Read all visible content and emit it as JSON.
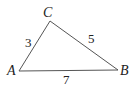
{
  "diagram": {
    "type": "triangle",
    "vertices": [
      {
        "name": "A",
        "x": 19,
        "y": 71,
        "label_x": 7,
        "label_y": 75
      },
      {
        "name": "B",
        "x": 118,
        "y": 70,
        "label_x": 120,
        "label_y": 75
      },
      {
        "name": "C",
        "x": 50,
        "y": 21,
        "label_x": 43,
        "label_y": 17
      }
    ],
    "sides": [
      {
        "between": "AC",
        "length": "3",
        "label_x": 25,
        "label_y": 47
      },
      {
        "between": "CB",
        "length": "5",
        "label_x": 88,
        "label_y": 43
      },
      {
        "between": "AB",
        "length": "7",
        "label_x": 63,
        "label_y": 84
      }
    ],
    "line_color": "#555555"
  }
}
